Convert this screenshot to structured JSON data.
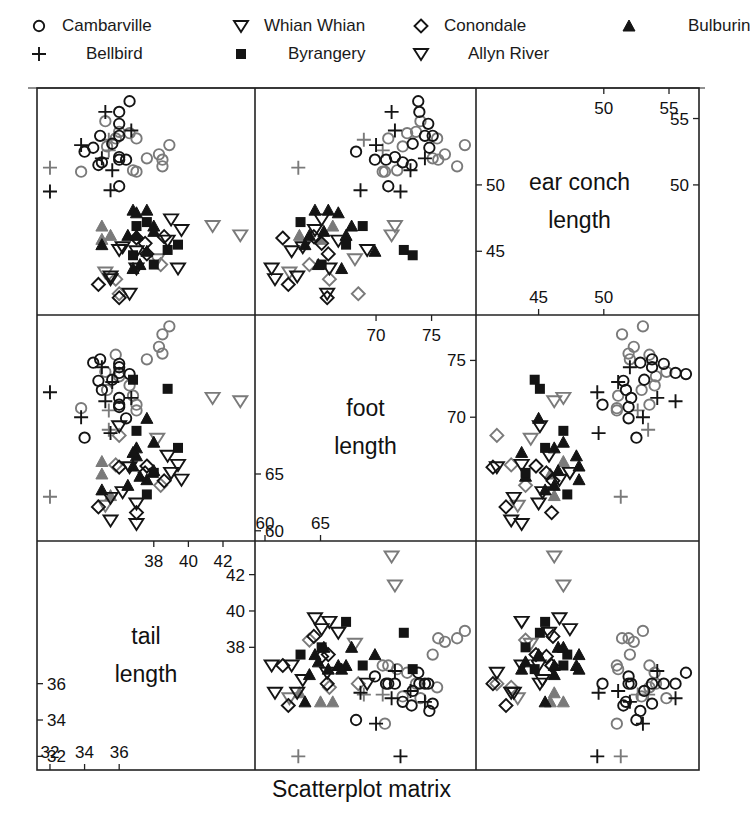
{
  "chart_data": {
    "type": "scatter",
    "subtype": "scatterplot-matrix",
    "title": "Scatterplot matrix",
    "variables": [
      {
        "key": "tail",
        "label_lines": [
          "tail",
          "length"
        ],
        "range": [
          31.25,
          43.85
        ],
        "ticks_low": [
          32,
          34,
          36
        ],
        "ticks_high": [
          38,
          40,
          42
        ]
      },
      {
        "key": "foot",
        "label_lines": [
          "foot",
          "length"
        ],
        "range": [
          59.1,
          79.0
        ],
        "ticks_low": [
          60,
          65
        ],
        "ticks_high": [
          70,
          75
        ]
      },
      {
        "key": "ear",
        "label_lines": [
          "ear conch",
          "length"
        ],
        "range": [
          40.2,
          57.3
        ],
        "ticks_low": [
          45,
          50
        ],
        "ticks_high": [
          50,
          55
        ]
      }
    ],
    "grid": {
      "x": [
        37,
        255,
        476,
        699
      ],
      "y": [
        88,
        315,
        541,
        770
      ]
    },
    "legend": {
      "position": "top",
      "entries": [
        {
          "site": "Cambarville",
          "symbol": "circle"
        },
        {
          "site": "Whian Whian",
          "symbol": "triangle-down"
        },
        {
          "site": "Conondale",
          "symbol": "diamond"
        },
        {
          "site": "Bulburin",
          "symbol": "triangle-up-filled"
        },
        {
          "site": "Bellbird",
          "symbol": "plus"
        },
        {
          "site": "Byrangery",
          "symbol": "square-filled"
        },
        {
          "site": "Allyn River",
          "symbol": "triangle-down"
        }
      ]
    },
    "colors": {
      "dark": "#141414",
      "gray": "#7a7a7a",
      "frame": "#222222"
    },
    "points": [
      {
        "site": "Cambarville",
        "shade": "dark",
        "foot": 73.8,
        "ear": 56.3,
        "tail": 36.6
      },
      {
        "site": "Cambarville",
        "shade": "dark",
        "foot": 73.9,
        "ear": 55.5,
        "tail": 36.0
      },
      {
        "site": "Bellbird",
        "shade": "dark",
        "foot": 71.4,
        "ear": 55.5,
        "tail": 35.2
      },
      {
        "site": "Cambarville",
        "shade": "dark",
        "foot": 74.7,
        "ear": 54.6,
        "tail": 36.0
      },
      {
        "site": "Bellbird",
        "shade": "dark",
        "foot": 71.7,
        "ear": 54.1,
        "tail": 36.7
      },
      {
        "site": "Cambarville",
        "shade": "dark",
        "foot": 74.4,
        "ear": 53.7,
        "tail": 36.0
      },
      {
        "site": "Cambarville",
        "shade": "dark",
        "foot": 75.1,
        "ear": 53.7,
        "tail": 34.9
      },
      {
        "site": "Cambarville",
        "shade": "gray",
        "foot": 73.6,
        "ear": 54.0,
        "tail": 36.0
      },
      {
        "site": "Cambarville",
        "shade": "gray",
        "foot": 72.8,
        "ear": 53.9,
        "tail": 36.6
      },
      {
        "site": "Cambarville",
        "shade": "gray",
        "foot": 71.1,
        "ear": 53.5,
        "tail": 37.0
      },
      {
        "site": "Bellbird",
        "shade": "gray",
        "foot": 68.9,
        "ear": 53.4,
        "tail": 35.4
      },
      {
        "site": "Cambarville",
        "shade": "gray",
        "foot": 78.0,
        "ear": 53.0,
        "tail": 38.9
      },
      {
        "site": "Cambarville",
        "shade": "dark",
        "foot": 73.3,
        "ear": 53.1,
        "tail": 35.6
      },
      {
        "site": "Cambarville",
        "shade": "gray",
        "foot": 72.4,
        "ear": 52.9,
        "tail": 35.3
      },
      {
        "site": "Cambarville",
        "shade": "gray",
        "foot": 76.2,
        "ear": 52.3,
        "tail": 38.3
      },
      {
        "site": "Cambarville",
        "shade": "gray",
        "foot": 75.1,
        "ear": 52.0,
        "tail": 37.6
      },
      {
        "site": "Cambarville",
        "shade": "dark",
        "foot": 68.2,
        "ear": 52.5,
        "tail": 34.0
      },
      {
        "site": "Bellbird",
        "shade": "gray",
        "foot": 70.6,
        "ear": 52.6,
        "tail": 35.4
      },
      {
        "site": "Cambarville",
        "shade": "dark",
        "foot": 71.7,
        "ear": 52.1,
        "tail": 36.0
      },
      {
        "site": "Cambarville",
        "shade": "dark",
        "foot": 69.9,
        "ear": 51.9,
        "tail": 36.4
      },
      {
        "site": "Cambarville",
        "shade": "dark",
        "foot": 70.9,
        "ear": 51.9,
        "tail": 36.0
      },
      {
        "site": "Cambarville",
        "shade": "dark",
        "foot": 72.4,
        "ear": 51.7,
        "tail": 35.0
      },
      {
        "site": "Cambarville",
        "shade": "dark",
        "foot": 73.2,
        "ear": 51.5,
        "tail": 34.8
      },
      {
        "site": "Bellbird",
        "shade": "dark",
        "foot": 74.4,
        "ear": 52.0,
        "tail": 35.0
      },
      {
        "site": "Cambarville",
        "shade": "gray",
        "foot": 77.3,
        "ear": 51.4,
        "tail": 38.5
      },
      {
        "site": "Cambarville",
        "shade": "gray",
        "foot": 71.9,
        "ear": 51.1,
        "tail": 36.8
      },
      {
        "site": "Cambarville",
        "shade": "gray",
        "foot": 70.6,
        "ear": 51.0,
        "tail": 37.0
      },
      {
        "site": "Cambarville",
        "shade": "gray",
        "foot": 70.8,
        "ear": 51.0,
        "tail": 33.8
      },
      {
        "site": "Bellbird",
        "shade": "dark",
        "foot": 73.1,
        "ear": 51.1,
        "tail": 35.6
      },
      {
        "site": "Cambarville",
        "shade": "gray",
        "foot": 75.6,
        "ear": 51.9,
        "tail": 38.5
      },
      {
        "site": "Bellbird",
        "shade": "gray",
        "foot": 63.0,
        "ear": 51.3,
        "tail": 32.0
      },
      {
        "site": "Bellbird",
        "shade": "dark",
        "foot": 68.6,
        "ear": 49.6,
        "tail": 35.5
      },
      {
        "site": "Cambarville",
        "shade": "dark",
        "foot": 71.1,
        "ear": 49.9,
        "tail": 36.0
      },
      {
        "site": "Bellbird",
        "shade": "dark",
        "foot": 72.2,
        "ear": 49.5,
        "tail": 32.0
      },
      {
        "site": "Bulburin",
        "shade": "dark",
        "foot": 64.5,
        "ear": 48.1,
        "tail": 37.6
      },
      {
        "site": "Bulburin",
        "shade": "dark",
        "foot": 65.7,
        "ear": 48.1,
        "tail": 36.8
      },
      {
        "site": "Bulburin",
        "shade": "dark",
        "foot": 66.6,
        "ear": 47.9,
        "tail": 37.0
      },
      {
        "site": "Bulburin",
        "shade": "gray",
        "foot": 66.1,
        "ear": 46.9,
        "tail": 35.0
      },
      {
        "site": "Bulburin",
        "shade": "dark",
        "foot": 67.8,
        "ear": 46.9,
        "tail": 38.0
      },
      {
        "site": "Byrangery",
        "shade": "dark",
        "foot": 68.8,
        "ear": 46.9,
        "tail": 37.0
      },
      {
        "site": "Byrangery",
        "shade": "dark",
        "foot": 63.2,
        "ear": 47.2,
        "tail": 37.6
      },
      {
        "site": "Whian Whian",
        "shade": "dark",
        "foot": 65.1,
        "ear": 47.4,
        "tail": 39.0
      },
      {
        "site": "Whian Whian",
        "shade": "dark",
        "foot": 64.5,
        "ear": 46.6,
        "tail": 39.6
      },
      {
        "site": "Allyn River",
        "shade": "gray",
        "foot": 71.7,
        "ear": 46.9,
        "tail": 41.4
      },
      {
        "site": "Allyn River",
        "shade": "gray",
        "foot": 71.4,
        "ear": 46.2,
        "tail": 43.0
      },
      {
        "site": "Conondale",
        "shade": "dark",
        "foot": 61.6,
        "ear": 46.0,
        "tail": 37.0
      },
      {
        "site": "Bulburin",
        "shade": "gray",
        "foot": 63.1,
        "ear": 46.2,
        "tail": 35.5
      },
      {
        "site": "Bulburin",
        "shade": "dark",
        "foot": 64.0,
        "ear": 46.2,
        "tail": 36.5
      },
      {
        "site": "Bulburin",
        "shade": "dark",
        "foot": 67.3,
        "ear": 46.2,
        "tail": 37.0
      },
      {
        "site": "Whian Whian",
        "shade": "dark",
        "foot": 66.6,
        "ear": 45.8,
        "tail": 38.8
      },
      {
        "site": "Byrangery",
        "shade": "dark",
        "foot": 67.3,
        "ear": 45.5,
        "tail": 39.4
      },
      {
        "site": "Bulburin",
        "shade": "dark",
        "foot": 63.6,
        "ear": 45.5,
        "tail": 35.0
      },
      {
        "site": "Conondale",
        "shade": "dark",
        "foot": 65.1,
        "ear": 45.6,
        "tail": 37.5
      },
      {
        "site": "Whian Whian",
        "shade": "dark",
        "foot": 62.4,
        "ear": 45.0,
        "tail": 37.0
      },
      {
        "site": "Whian Whian",
        "shade": "dark",
        "foot": 69.2,
        "ear": 45.1,
        "tail": 36.0
      },
      {
        "site": "Bulburin",
        "shade": "dark",
        "foot": 69.9,
        "ear": 45.0,
        "tail": 37.6
      },
      {
        "site": "Allyn River",
        "shade": "gray",
        "foot": 68.1,
        "ear": 44.4,
        "tail": 38.2
      },
      {
        "site": "Byrangery",
        "shade": "dark",
        "foot": 72.5,
        "ear": 45.1,
        "tail": 38.8
      },
      {
        "site": "Byrangery",
        "shade": "dark",
        "foot": 73.3,
        "ear": 44.7,
        "tail": 36.8
      },
      {
        "site": "Conondale",
        "shade": "dark",
        "foot": 65.7,
        "ear": 44.8,
        "tail": 37.6
      },
      {
        "site": "Bulburin",
        "shade": "dark",
        "foot": 64.8,
        "ear": 44.0,
        "tail": 37.2
      },
      {
        "site": "Conondale",
        "shade": "gray",
        "foot": 64.0,
        "ear": 44.0,
        "tail": 38.4
      },
      {
        "site": "Whian Whian",
        "shade": "dark",
        "foot": 60.6,
        "ear": 43.7,
        "tail": 37.0
      },
      {
        "site": "Whian Whian",
        "shade": "dark",
        "foot": 60.9,
        "ear": 42.9,
        "tail": 35.5
      },
      {
        "site": "Allyn River",
        "shade": "gray",
        "foot": 62.2,
        "ear": 43.4,
        "tail": 35.2
      },
      {
        "site": "Whian Whian",
        "shade": "dark",
        "foot": 62.9,
        "ear": 43.1,
        "tail": 35.5
      },
      {
        "site": "Conondale",
        "shade": "dark",
        "foot": 62.1,
        "ear": 42.5,
        "tail": 34.8
      },
      {
        "site": "Bulburin",
        "shade": "dark",
        "foot": 66.9,
        "ear": 43.7,
        "tail": 36.8
      },
      {
        "site": "Whian Whian",
        "shade": "dark",
        "foot": 65.8,
        "ear": 43.7,
        "tail": 39.4
      },
      {
        "site": "Conondale",
        "shade": "gray",
        "foot": 65.8,
        "ear": 42.9,
        "tail": 35.8
      },
      {
        "site": "Whian Whian",
        "shade": "dark",
        "foot": 65.6,
        "ear": 41.8,
        "tail": 36.6
      },
      {
        "site": "Conondale",
        "shade": "dark",
        "foot": 65.6,
        "ear": 41.5,
        "tail": 36.0
      },
      {
        "site": "Conondale",
        "shade": "gray",
        "foot": 68.4,
        "ear": 41.8,
        "tail": 36.0
      },
      {
        "site": "Byrangery",
        "shade": "dark",
        "foot": 65.1,
        "ear": 44.0,
        "tail": 38.0
      },
      {
        "site": "Cambarville",
        "shade": "gray",
        "foot": 74.0,
        "ear": 54.8,
        "tail": 35.2
      },
      {
        "site": "Cambarville",
        "shade": "dark",
        "foot": 74.8,
        "ear": 52.8,
        "tail": 34.5
      },
      {
        "site": "Bellbird",
        "shade": "dark",
        "foot": 70.0,
        "ear": 53.0,
        "tail": 33.8
      },
      {
        "site": "Cambarville",
        "shade": "gray",
        "foot": 75.5,
        "ear": 53.5,
        "tail": 35.8
      },
      {
        "site": "Bulburin",
        "shade": "dark",
        "foot": 65.3,
        "ear": 46.5,
        "tail": 38.0
      },
      {
        "site": "Whian Whian",
        "shade": "dark",
        "foot": 63.4,
        "ear": 45.3,
        "tail": 36.2
      },
      {
        "site": "Conondale",
        "shade": "dark",
        "foot": 64.4,
        "ear": 46.1,
        "tail": 38.6
      },
      {
        "site": "Bulburin",
        "shade": "gray",
        "foot": 65.0,
        "ear": 45.9,
        "tail": 35.0
      }
    ]
  }
}
